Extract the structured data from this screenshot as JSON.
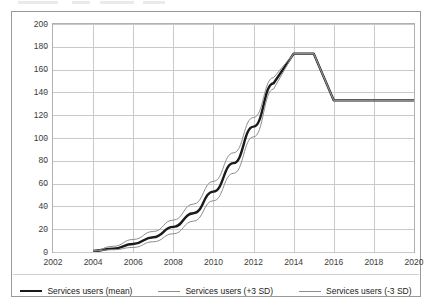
{
  "chart_data": {
    "type": "line",
    "title": "",
    "xlabel": "",
    "ylabel": "",
    "xlim": [
      2002,
      2020
    ],
    "ylim": [
      0,
      200
    ],
    "grid": true,
    "legend_position": "bottom",
    "xticks": [
      2002,
      2004,
      2006,
      2008,
      2010,
      2012,
      2014,
      2016,
      2018,
      2020
    ],
    "yticks": [
      0,
      20,
      40,
      60,
      80,
      100,
      120,
      140,
      160,
      180,
      200
    ],
    "x": [
      2002,
      2003,
      2004,
      2005,
      2006,
      2007,
      2008,
      2009,
      2010,
      2011,
      2012,
      2013,
      2014,
      2015,
      2016,
      2017,
      2018,
      2019,
      2020
    ],
    "series": [
      {
        "name": "Services users (mean)",
        "color": "#1a1a1a",
        "width": 2.4,
        "values": [
          null,
          null,
          1,
          3,
          7,
          13,
          22,
          34,
          53,
          78,
          110,
          148,
          174,
          174,
          133,
          133,
          133,
          133,
          133
        ]
      },
      {
        "name": "Services users (+3 SD)",
        "color": "#8d8d8d",
        "width": 1,
        "values": [
          null,
          null,
          1,
          5,
          11,
          18,
          28,
          42,
          62,
          87,
          118,
          153,
          174,
          174,
          133,
          133,
          133,
          133,
          133
        ]
      },
      {
        "name": "Services users (-3 SD)",
        "color": "#8d8d8d",
        "width": 1,
        "values": [
          null,
          null,
          1,
          2,
          4,
          9,
          16,
          27,
          45,
          69,
          101,
          143,
          174,
          174,
          133,
          133,
          133,
          133,
          133
        ]
      }
    ],
    "annotations": {
      "plateau_value": 174,
      "plateau_start_year": 2013,
      "plateau_end_year": 2015,
      "post_drop_value": 133,
      "post_drop_year": 2016
    }
  },
  "legend": {
    "items": [
      {
        "label": "Services users (mean)",
        "style": "mean"
      },
      {
        "label": "Services users (+3 SD)",
        "style": "band"
      },
      {
        "label": "Services users (-3 SD)",
        "style": "band"
      }
    ]
  }
}
